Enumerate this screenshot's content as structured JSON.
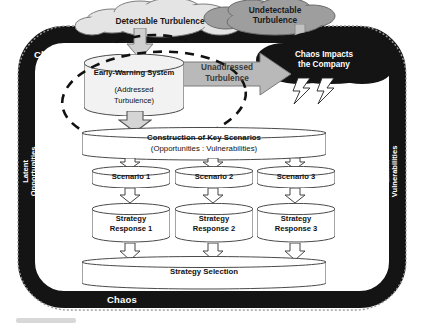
{
  "diagram": {
    "frame": {
      "chaos_top": "Chaos",
      "chaos_bottom": "Chaos",
      "left_side": "Latent\nOpportunities",
      "left_side_line1": "Latent",
      "left_side_line2": "Opportunities",
      "right_side_line1": "Latent",
      "right_side_line2": "Vulnerabilities"
    },
    "clouds": [
      {
        "id": "detectable",
        "label": "Detectable Turbulence",
        "color": "#e2e2e2",
        "text_color": "#1a1a1a"
      },
      {
        "id": "undetectable",
        "label_line1": "Undetectable",
        "label_line2": "Turbulence",
        "color": "#9d9d9d",
        "text_color": "#1a1a1a"
      },
      {
        "id": "storm",
        "label_line1": "Chaos Impacts",
        "label_line2": "the Company",
        "color": "#141414",
        "text_color": "#ffffff"
      }
    ],
    "flows": {
      "unaddressed_line1": "Unaddressed",
      "unaddressed_line2": "Turbulence"
    },
    "nodes": {
      "early_warning": {
        "line1": "Early-Warning System",
        "line2": "(Addressed",
        "line3": "Turbulence)"
      },
      "construction": {
        "line1": "Construction of Key Scenarios",
        "line2": "(Opportunities :  Vulnerabilities)"
      },
      "scenarios": [
        "Scenario 1",
        "Scenario 2",
        "Scenario 3"
      ],
      "responses": [
        {
          "line1": "Strategy",
          "line2": "Response 1"
        },
        {
          "line1": "Strategy",
          "line2": "Response 2"
        },
        {
          "line1": "Strategy",
          "line2": "Response 3"
        }
      ],
      "selection": "Strategy Selection"
    },
    "colors": {
      "frame": "#141414",
      "cylinder_fill": "#f2f2f2",
      "cylinder_stroke": "#555555",
      "arrow_fill": "#bdbdbd",
      "arrow_stroke": "#6e6e6e",
      "thin_arrow_stroke": "#444444"
    }
  }
}
